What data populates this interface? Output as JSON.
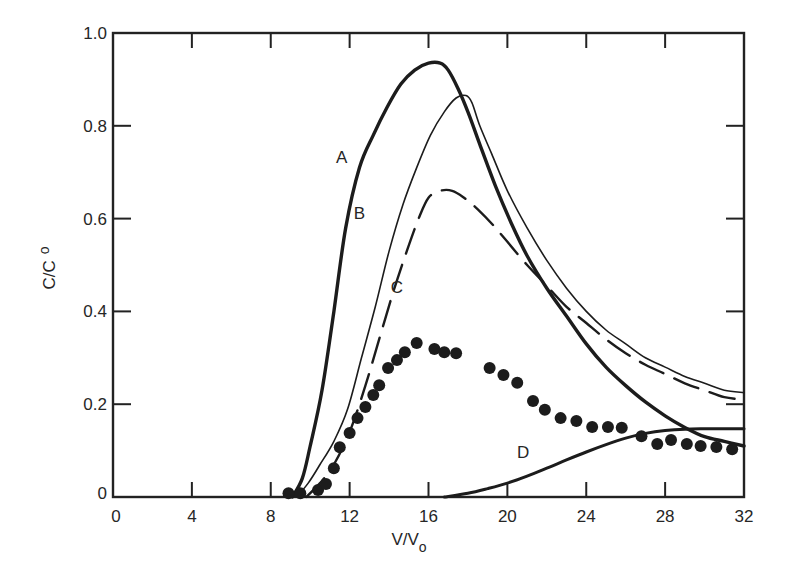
{
  "chart_data": {
    "type": "line",
    "title": "",
    "xlabel": "V/V",
    "xlabel_sub": "o",
    "ylabel": "C/C",
    "ylabel_sub": "o",
    "xlim": [
      0,
      32
    ],
    "ylim": [
      0,
      1.0
    ],
    "x_ticks": [
      0,
      4,
      8,
      12,
      16,
      20,
      24,
      28,
      32
    ],
    "x_tick_labels": [
      "0",
      "4",
      "8",
      "12",
      "16",
      "20",
      "24",
      "28",
      "32"
    ],
    "y_ticks": [
      0,
      0.2,
      0.4,
      0.6,
      0.8,
      1.0
    ],
    "y_tick_labels": [
      "0",
      "0.2",
      "0.4",
      "0.6",
      "0.8",
      "1.0"
    ],
    "grid": false,
    "legend": "inline labels",
    "series": [
      {
        "name": "A",
        "style": "thick-solid",
        "label_pos": [
          11.6,
          0.72
        ],
        "x": [
          9.1,
          9.6,
          10.0,
          10.6,
          11.2,
          11.8,
          12.5,
          13.2,
          13.9,
          14.6,
          15.3,
          16.0,
          16.6,
          17.0,
          17.5,
          18.0,
          18.6,
          19.4,
          20.2,
          21.0,
          22.0,
          23.0,
          24.0,
          25.0,
          26.0,
          27.0,
          28.0,
          29.0,
          30.0,
          31.0,
          32.0
        ],
        "y": [
          0.0,
          0.04,
          0.11,
          0.23,
          0.4,
          0.58,
          0.71,
          0.78,
          0.84,
          0.89,
          0.92,
          0.935,
          0.935,
          0.92,
          0.88,
          0.83,
          0.76,
          0.67,
          0.59,
          0.52,
          0.45,
          0.39,
          0.33,
          0.28,
          0.24,
          0.205,
          0.175,
          0.15,
          0.13,
          0.12,
          0.11
        ]
      },
      {
        "name": "B",
        "style": "thin-solid",
        "label_pos": [
          12.5,
          0.6
        ],
        "x": [
          9.3,
          9.9,
          10.5,
          11.2,
          11.9,
          12.6,
          13.3,
          14.0,
          14.7,
          15.4,
          16.1,
          16.8,
          17.4,
          17.9,
          18.2,
          18.6,
          19.2,
          20.0,
          21.0,
          22.0,
          23.0,
          24.0,
          25.0,
          26.0,
          27.0,
          28.0,
          29.0,
          30.0,
          31.0,
          32.0
        ],
        "y": [
          0.0,
          0.03,
          0.07,
          0.12,
          0.19,
          0.3,
          0.41,
          0.53,
          0.63,
          0.71,
          0.78,
          0.83,
          0.86,
          0.865,
          0.85,
          0.8,
          0.74,
          0.66,
          0.58,
          0.51,
          0.45,
          0.4,
          0.36,
          0.33,
          0.3,
          0.28,
          0.26,
          0.245,
          0.23,
          0.225
        ]
      },
      {
        "name": "C",
        "style": "dashed",
        "label_pos": [
          14.4,
          0.44
        ],
        "x": [
          9.8,
          10.5,
          11.2,
          12.0,
          12.8,
          13.5,
          14.2,
          14.9,
          15.5,
          16.0,
          16.6,
          17.2,
          17.8,
          18.5,
          19.3,
          20.0,
          21.0,
          22.0,
          23.0,
          24.0,
          25.0,
          26.0,
          27.0,
          28.0,
          29.0,
          30.0,
          31.0,
          32.0
        ],
        "y": [
          0.0,
          0.03,
          0.07,
          0.14,
          0.24,
          0.34,
          0.44,
          0.53,
          0.6,
          0.645,
          0.66,
          0.66,
          0.645,
          0.62,
          0.585,
          0.55,
          0.5,
          0.455,
          0.41,
          0.375,
          0.34,
          0.31,
          0.285,
          0.265,
          0.245,
          0.23,
          0.215,
          0.21
        ]
      },
      {
        "name": "D",
        "style": "medium-solid",
        "label_pos": [
          20.8,
          0.085
        ],
        "x": [
          16.8,
          18.0,
          19.0,
          20.0,
          21.0,
          22.0,
          23.0,
          24.0,
          25.0,
          26.0,
          27.0,
          28.0,
          29.0,
          30.0,
          31.0,
          32.0
        ],
        "y": [
          0.0,
          0.008,
          0.018,
          0.03,
          0.045,
          0.062,
          0.08,
          0.097,
          0.113,
          0.127,
          0.137,
          0.143,
          0.146,
          0.147,
          0.147,
          0.147
        ]
      },
      {
        "name": "experimental points",
        "style": "dots",
        "x": [
          8.9,
          9.5,
          10.4,
          10.8,
          11.2,
          11.5,
          12.0,
          12.4,
          12.8,
          13.2,
          13.5,
          13.95,
          14.4,
          14.8,
          15.4,
          16.3,
          16.8,
          17.4,
          19.1,
          19.8,
          20.5,
          21.3,
          21.9,
          22.7,
          23.5,
          24.3,
          25.1,
          25.8,
          26.8,
          27.6,
          28.3,
          29.1,
          29.8,
          30.6,
          31.4
        ],
        "y": [
          0.008,
          0.008,
          0.015,
          0.028,
          0.062,
          0.107,
          0.138,
          0.17,
          0.194,
          0.22,
          0.241,
          0.278,
          0.295,
          0.312,
          0.332,
          0.319,
          0.312,
          0.31,
          0.278,
          0.263,
          0.246,
          0.207,
          0.188,
          0.17,
          0.164,
          0.151,
          0.151,
          0.149,
          0.131,
          0.114,
          0.123,
          0.114,
          0.11,
          0.108,
          0.103
        ]
      }
    ]
  }
}
